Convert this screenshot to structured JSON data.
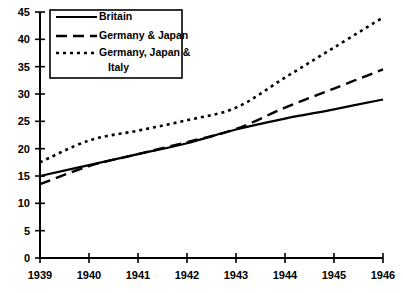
{
  "chart_data": {
    "type": "line",
    "title": "",
    "subtitle": "",
    "xlabel": "",
    "ylabel": "",
    "x": [
      1939,
      1940,
      1941,
      1942,
      1943,
      1944,
      1945,
      1946
    ],
    "categories": [
      "1939",
      "1940",
      "1941",
      "1942",
      "1943",
      "1944",
      "1945",
      "1946"
    ],
    "xlim": [
      1939,
      1946
    ],
    "ylim": [
      0,
      45
    ],
    "y_ticks": [
      0,
      5,
      10,
      15,
      20,
      25,
      30,
      35,
      40,
      45
    ],
    "y_tick_labels": [
      "0",
      "5",
      "10",
      "15",
      "20",
      "25",
      "30",
      "35",
      "40",
      "45"
    ],
    "x_ticks": [
      1939,
      1940,
      1941,
      1942,
      1943,
      1944,
      1945,
      1946
    ],
    "x_tick_labels": [
      "1939",
      "1940",
      "1941",
      "1942",
      "1943",
      "1944",
      "1945",
      "1946"
    ],
    "grid": false,
    "legend_position": "upper-left",
    "series": [
      {
        "name": "Britain",
        "style": "solid",
        "color": "#000000",
        "values": [
          15.0,
          17.0,
          19.0,
          21.0,
          23.5,
          25.5,
          27.2,
          29.0
        ]
      },
      {
        "name": "Germany & Japan",
        "style": "dashed",
        "color": "#000000",
        "values": [
          13.5,
          16.8,
          19.0,
          21.2,
          23.6,
          27.5,
          31.0,
          34.5
        ]
      },
      {
        "name": "Germany, Japan & Italy",
        "style": "dotted",
        "color": "#000000",
        "values": [
          17.5,
          21.5,
          23.3,
          25.2,
          27.5,
          33.0,
          38.5,
          44.0
        ]
      }
    ]
  },
  "legend": {
    "entries": [
      {
        "label": "Britain",
        "style": "solid"
      },
      {
        "label": "Germany & Japan",
        "style": "dashed"
      },
      {
        "label": "Germany, Japan &",
        "style": "dotted"
      },
      {
        "label": "Italy",
        "style": "none"
      }
    ]
  },
  "axis": {
    "y_labels": [
      "45",
      "40",
      "35",
      "30",
      "25",
      "20",
      "15",
      "10",
      "5",
      "0"
    ],
    "x_labels": [
      "1939",
      "1940",
      "1941",
      "1942",
      "1943",
      "1944",
      "1945",
      "1946"
    ]
  }
}
